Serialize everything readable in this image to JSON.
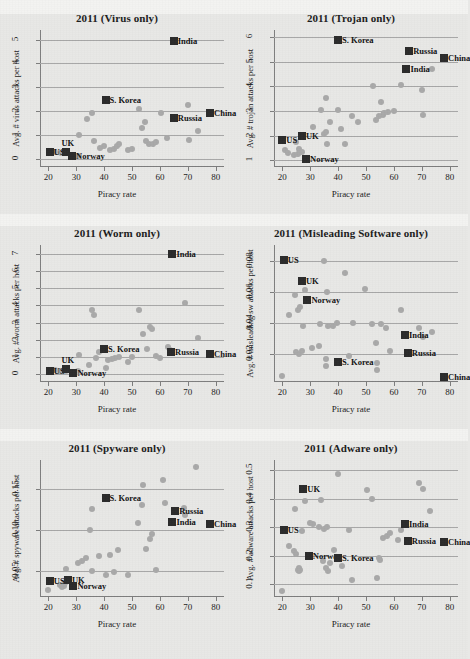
{
  "figure": {
    "xlabel": "Piracy rate",
    "xticks": [
      20,
      30,
      40,
      50,
      60,
      70,
      80
    ],
    "xlim": [
      17,
      83
    ]
  },
  "chart_data": [
    {
      "type": "scatter",
      "title": "2011 (Virus only)",
      "xlabel": "Piracy rate",
      "ylabel": "Avg. # virus attacks per host",
      "xlim": [
        17,
        83
      ],
      "ylim": [
        -0.35,
        5.4
      ],
      "yticks": [
        0,
        1,
        2,
        3,
        4,
        5
      ],
      "ytick_labels": [
        "0",
        "1",
        "2",
        "3",
        "4",
        "5"
      ],
      "grid": true,
      "legend": "none",
      "points": [
        [
          22.5,
          0.28
        ],
        [
          24.5,
          0.22
        ],
        [
          25.5,
          0.3
        ],
        [
          26.0,
          0.25
        ],
        [
          30.5,
          0.1
        ],
        [
          31.0,
          1.0
        ],
        [
          34.0,
          1.65
        ],
        [
          35.5,
          1.92
        ],
        [
          36.5,
          0.75
        ],
        [
          38.5,
          0.45
        ],
        [
          40.0,
          0.55
        ],
        [
          42.0,
          0.35
        ],
        [
          43.5,
          0.42
        ],
        [
          44.5,
          0.55
        ],
        [
          45.5,
          0.6
        ],
        [
          48.5,
          0.35
        ],
        [
          50.0,
          0.4
        ],
        [
          52.5,
          2.1
        ],
        [
          53.5,
          1.3
        ],
        [
          54.5,
          1.55
        ],
        [
          55.0,
          0.75
        ],
        [
          56.0,
          0.6
        ],
        [
          57.5,
          0.62
        ],
        [
          58.5,
          0.7
        ],
        [
          60.5,
          1.9
        ],
        [
          62.5,
          0.85
        ],
        [
          70.0,
          2.25
        ],
        [
          70.5,
          0.78
        ],
        [
          73.5,
          1.15
        ]
      ],
      "highlights": [
        {
          "label": "US",
          "x": 20.5,
          "y": 0.3,
          "anchor": "right"
        },
        {
          "label": "UK",
          "x": 26.5,
          "y": 0.3,
          "anchor": "top"
        },
        {
          "label": "Norway",
          "x": 28.5,
          "y": 0.12,
          "anchor": "right"
        },
        {
          "label": "S. Korea",
          "x": 40.5,
          "y": 2.45,
          "anchor": "right"
        },
        {
          "label": "Russia",
          "x": 65.0,
          "y": 1.7,
          "anchor": "right"
        },
        {
          "label": "China",
          "x": 78.0,
          "y": 1.9,
          "anchor": "right"
        },
        {
          "label": "India",
          "x": 65.0,
          "y": 4.95,
          "anchor": "right"
        }
      ]
    },
    {
      "type": "scatter",
      "title": "2011 (Trojan only)",
      "xlabel": "Piracy rate",
      "ylabel": "Avg. # trojan attacks per host",
      "xlim": [
        17,
        83
      ],
      "ylim": [
        0.72,
        6.3
      ],
      "yticks": [
        1,
        2,
        3,
        4,
        5,
        6
      ],
      "ytick_labels": [
        "1",
        "2",
        "3",
        "4",
        "5",
        "6"
      ],
      "grid": true,
      "legend": "none",
      "points": [
        [
          21.0,
          1.4
        ],
        [
          22.0,
          1.3
        ],
        [
          24.0,
          1.2
        ],
        [
          25.0,
          1.75
        ],
        [
          25.5,
          1.25
        ],
        [
          26.0,
          1.45
        ],
        [
          27.0,
          1.35
        ],
        [
          31.0,
          2.35
        ],
        [
          34.0,
          3.05
        ],
        [
          35.0,
          2.05
        ],
        [
          35.5,
          3.55
        ],
        [
          35.5,
          2.15
        ],
        [
          36.0,
          1.65
        ],
        [
          37.0,
          2.55
        ],
        [
          40.0,
          3.05
        ],
        [
          41.0,
          2.25
        ],
        [
          42.5,
          1.65
        ],
        [
          45.0,
          2.8
        ],
        [
          47.0,
          2.55
        ],
        [
          52.5,
          4.0
        ],
        [
          53.5,
          2.65
        ],
        [
          54.5,
          2.8
        ],
        [
          55.5,
          3.35
        ],
        [
          56.0,
          2.85
        ],
        [
          56.5,
          2.9
        ],
        [
          58.0,
          2.95
        ],
        [
          60.0,
          3.0
        ],
        [
          62.5,
          4.05
        ],
        [
          70.0,
          3.85
        ],
        [
          70.5,
          2.85
        ],
        [
          73.5,
          4.7
        ]
      ],
      "highlights": [
        {
          "label": "US",
          "x": 20.0,
          "y": 1.8,
          "anchor": "right"
        },
        {
          "label": "UK",
          "x": 27.0,
          "y": 2.0,
          "anchor": "right"
        },
        {
          "label": "Norway",
          "x": 28.5,
          "y": 1.05,
          "anchor": "right"
        },
        {
          "label": "S. Korea",
          "x": 40.0,
          "y": 5.9,
          "anchor": "right"
        },
        {
          "label": "Russia",
          "x": 65.5,
          "y": 5.45,
          "anchor": "right"
        },
        {
          "label": "China",
          "x": 78.0,
          "y": 5.15,
          "anchor": "right"
        },
        {
          "label": "India",
          "x": 64.5,
          "y": 4.7,
          "anchor": "right"
        }
      ]
    },
    {
      "type": "scatter",
      "title": "2011 (Worm only)",
      "xlabel": "Piracy rate",
      "ylabel": "Avg. # worm attacks per host",
      "xlim": [
        17,
        83
      ],
      "ylim": [
        -0.45,
        7.5
      ],
      "yticks": [
        0,
        1,
        2,
        3,
        4,
        5,
        6,
        7
      ],
      "ytick_labels": [
        "0",
        "1",
        "2",
        "3",
        "4",
        "5",
        "6",
        "7"
      ],
      "grid": true,
      "legend": "none",
      "points": [
        [
          22.5,
          0.22
        ],
        [
          24.0,
          0.18
        ],
        [
          25.5,
          0.25
        ],
        [
          26.5,
          0.2
        ],
        [
          30.5,
          0.2
        ],
        [
          31.0,
          1.1
        ],
        [
          34.5,
          0.55
        ],
        [
          35.5,
          3.7
        ],
        [
          36.5,
          3.45
        ],
        [
          37.0,
          0.95
        ],
        [
          38.0,
          1.3
        ],
        [
          40.5,
          0.35
        ],
        [
          41.5,
          0.85
        ],
        [
          43.0,
          0.9
        ],
        [
          44.0,
          0.95
        ],
        [
          45.5,
          1.0
        ],
        [
          48.5,
          0.7
        ],
        [
          50.0,
          1.0
        ],
        [
          52.5,
          3.7
        ],
        [
          54.0,
          2.35
        ],
        [
          55.5,
          1.45
        ],
        [
          56.5,
          2.75
        ],
        [
          57.0,
          2.6
        ],
        [
          58.5,
          1.05
        ],
        [
          60.0,
          0.95
        ],
        [
          63.0,
          1.6
        ],
        [
          63.5,
          1.4
        ],
        [
          69.0,
          4.15
        ],
        [
          73.5,
          2.1
        ]
      ],
      "highlights": [
        {
          "label": "US",
          "x": 20.5,
          "y": 0.18,
          "anchor": "right"
        },
        {
          "label": "UK",
          "x": 26.5,
          "y": 0.28,
          "anchor": "top"
        },
        {
          "label": "Norway",
          "x": 29.0,
          "y": 0.1,
          "anchor": "right"
        },
        {
          "label": "S. Korea",
          "x": 40.0,
          "y": 1.45,
          "anchor": "right"
        },
        {
          "label": "Russia",
          "x": 64.0,
          "y": 1.3,
          "anchor": "right"
        },
        {
          "label": "China",
          "x": 78.0,
          "y": 1.15,
          "anchor": "right"
        },
        {
          "label": "India",
          "x": 64.5,
          "y": 7.0,
          "anchor": "right"
        }
      ]
    },
    {
      "type": "scatter",
      "title": "2011 (Misleading Software only)",
      "xlabel": "Piracy rate",
      "ylabel": "Avg. # misleading sw attacks per host",
      "xlim": [
        17,
        83
      ],
      "ylim": [
        0.002,
        0.09
      ],
      "yticks": [
        0.02,
        0.04,
        0.06,
        0.08
      ],
      "ytick_labels": [
        "0.02",
        "0.04",
        "0.06",
        "0.08"
      ],
      "grid": true,
      "legend": "none",
      "points": [
        [
          20.0,
          0.006
        ],
        [
          22.5,
          0.045
        ],
        [
          24.5,
          0.058
        ],
        [
          25.0,
          0.021
        ],
        [
          25.5,
          0.048
        ],
        [
          26.0,
          0.02
        ],
        [
          26.5,
          0.05
        ],
        [
          27.0,
          0.022
        ],
        [
          27.5,
          0.038
        ],
        [
          28.0,
          0.061
        ],
        [
          30.5,
          0.024
        ],
        [
          33.0,
          0.025
        ],
        [
          33.5,
          0.039
        ],
        [
          35.0,
          0.08
        ],
        [
          35.5,
          0.017
        ],
        [
          35.5,
          0.012
        ],
        [
          36.0,
          0.06
        ],
        [
          36.5,
          0.038
        ],
        [
          38.0,
          0.038
        ],
        [
          39.5,
          0.04
        ],
        [
          42.5,
          0.072
        ],
        [
          44.0,
          0.019
        ],
        [
          45.5,
          0.04
        ],
        [
          49.5,
          0.062
        ],
        [
          52.0,
          0.039
        ],
        [
          53.5,
          0.027
        ],
        [
          54.0,
          0.014
        ],
        [
          54.0,
          0.01
        ],
        [
          55.5,
          0.039
        ],
        [
          57.0,
          0.037
        ],
        [
          58.5,
          0.022
        ],
        [
          62.5,
          0.048
        ],
        [
          69.0,
          0.037
        ],
        [
          70.5,
          0.031
        ],
        [
          73.5,
          0.034
        ]
      ],
      "highlights": [
        {
          "label": "US",
          "x": 20.5,
          "y": 0.0805,
          "anchor": "right"
        },
        {
          "label": "UK",
          "x": 27.0,
          "y": 0.067,
          "anchor": "right"
        },
        {
          "label": "Norway",
          "x": 29.0,
          "y": 0.0545,
          "anchor": "right"
        },
        {
          "label": "S. Korea",
          "x": 40.0,
          "y": 0.015,
          "anchor": "right"
        },
        {
          "label": "Russia",
          "x": 65.0,
          "y": 0.0205,
          "anchor": "right"
        },
        {
          "label": "China",
          "x": 78.0,
          "y": 0.0055,
          "anchor": "right"
        },
        {
          "label": "India",
          "x": 64.0,
          "y": 0.0325,
          "anchor": "right"
        }
      ]
    },
    {
      "type": "scatter",
      "title": "2011 (Spyware only)",
      "xlabel": "Piracy rate",
      "ylabel": "Avg. # spyware attacks per host",
      "xlim": [
        17,
        83
      ],
      "ylim": [
        0.018,
        0.185
      ],
      "yticks": [
        0.05,
        0.1,
        0.15
      ],
      "ytick_labels": [
        "0.05",
        "0.10",
        "0.15"
      ],
      "grid": true,
      "legend": "none",
      "points": [
        [
          20.0,
          0.026
        ],
        [
          24.0,
          0.033
        ],
        [
          25.0,
          0.03
        ],
        [
          25.5,
          0.032
        ],
        [
          26.0,
          0.035
        ],
        [
          26.5,
          0.052
        ],
        [
          30.5,
          0.06
        ],
        [
          32.0,
          0.062
        ],
        [
          33.5,
          0.065
        ],
        [
          35.0,
          0.1
        ],
        [
          35.5,
          0.05
        ],
        [
          35.5,
          0.125
        ],
        [
          38.0,
          0.068
        ],
        [
          40.5,
          0.045
        ],
        [
          42.0,
          0.069
        ],
        [
          43.5,
          0.048
        ],
        [
          45.0,
          0.075
        ],
        [
          48.5,
          0.045
        ],
        [
          52.0,
          0.108
        ],
        [
          53.5,
          0.13
        ],
        [
          54.0,
          0.155
        ],
        [
          55.0,
          0.077
        ],
        [
          56.5,
          0.089
        ],
        [
          57.0,
          0.095
        ],
        [
          58.5,
          0.051
        ],
        [
          61.0,
          0.161
        ],
        [
          62.0,
          0.132
        ],
        [
          68.5,
          0.127
        ],
        [
          69.0,
          0.118
        ],
        [
          73.0,
          0.176
        ]
      ],
      "highlights": [
        {
          "label": "US",
          "x": 20.5,
          "y": 0.038,
          "anchor": "right"
        },
        {
          "label": "UK",
          "x": 27.0,
          "y": 0.039,
          "anchor": "right"
        },
        {
          "label": "Norway",
          "x": 29.0,
          "y": 0.031,
          "anchor": "right"
        },
        {
          "label": "S. Korea",
          "x": 40.5,
          "y": 0.139,
          "anchor": "right"
        },
        {
          "label": "Russia",
          "x": 65.5,
          "y": 0.123,
          "anchor": "right"
        },
        {
          "label": "China",
          "x": 78.0,
          "y": 0.107,
          "anchor": "right"
        },
        {
          "label": "India",
          "x": 64.5,
          "y": 0.11,
          "anchor": "right"
        }
      ]
    },
    {
      "type": "scatter",
      "title": "2011 (Adware only)",
      "xlabel": "Piracy rate",
      "ylabel": "Avg. # adware attacks per host",
      "xlim": [
        17,
        83
      ],
      "ylim": [
        0.055,
        0.535
      ],
      "yticks": [
        0.1,
        0.2,
        0.3,
        0.4,
        0.5
      ],
      "ytick_labels": [
        "0.1",
        "0.2",
        "0.3",
        "0.4",
        "0.5"
      ],
      "grid": true,
      "legend": "none",
      "points": [
        [
          20.0,
          0.075
        ],
        [
          22.5,
          0.235
        ],
        [
          24.0,
          0.215
        ],
        [
          24.5,
          0.365
        ],
        [
          25.0,
          0.205
        ],
        [
          25.5,
          0.15
        ],
        [
          26.0,
          0.145
        ],
        [
          26.0,
          0.155
        ],
        [
          26.5,
          0.148
        ],
        [
          27.0,
          0.285
        ],
        [
          28.0,
          0.39
        ],
        [
          30.0,
          0.315
        ],
        [
          31.0,
          0.31
        ],
        [
          33.0,
          0.3
        ],
        [
          34.0,
          0.395
        ],
        [
          34.5,
          0.18
        ],
        [
          35.0,
          0.295
        ],
        [
          35.5,
          0.155
        ],
        [
          36.0,
          0.3
        ],
        [
          36.5,
          0.145
        ],
        [
          37.0,
          0.175
        ],
        [
          38.5,
          0.22
        ],
        [
          40.0,
          0.485
        ],
        [
          41.5,
          0.165
        ],
        [
          44.0,
          0.29
        ],
        [
          45.0,
          0.115
        ],
        [
          50.5,
          0.43
        ],
        [
          52.0,
          0.4
        ],
        [
          54.0,
          0.12
        ],
        [
          54.5,
          0.19
        ],
        [
          55.0,
          0.185
        ],
        [
          56.0,
          0.26
        ],
        [
          57.5,
          0.27
        ],
        [
          58.5,
          0.28
        ],
        [
          61.5,
          0.255
        ],
        [
          62.5,
          0.29
        ],
        [
          69.0,
          0.455
        ],
        [
          70.5,
          0.435
        ],
        [
          73.0,
          0.355
        ]
      ],
      "highlights": [
        {
          "label": "US",
          "x": 20.5,
          "y": 0.29,
          "anchor": "right"
        },
        {
          "label": "UK",
          "x": 27.5,
          "y": 0.435,
          "anchor": "right"
        },
        {
          "label": "Norway",
          "x": 29.5,
          "y": 0.2,
          "anchor": "right"
        },
        {
          "label": "S. Korea",
          "x": 40.0,
          "y": 0.19,
          "anchor": "right"
        },
        {
          "label": "Russia",
          "x": 65.0,
          "y": 0.25,
          "anchor": "right"
        },
        {
          "label": "China",
          "x": 78.0,
          "y": 0.247,
          "anchor": "right"
        },
        {
          "label": "India",
          "x": 64.0,
          "y": 0.312,
          "anchor": "right"
        }
      ]
    }
  ],
  "style": {
    "point_color": "#a9a9a9",
    "marker_color": "#2b2b2b",
    "grid_color": "#a7a7a7",
    "axis_color": "#7d7d7d",
    "background": "#e8e8e6",
    "band_color": "#f3f3f1"
  }
}
